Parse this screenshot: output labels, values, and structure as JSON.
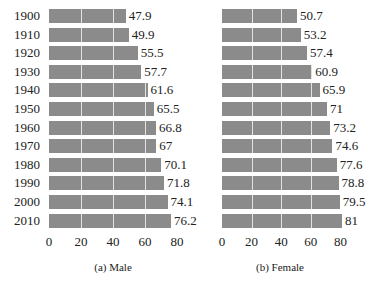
{
  "chart_data": [
    {
      "type": "bar",
      "orientation": "horizontal",
      "title": "",
      "caption": "(a) Male",
      "xlabel": "",
      "ylabel": "",
      "categories": [
        "1900",
        "1910",
        "1920",
        "1930",
        "1940",
        "1950",
        "1960",
        "1970",
        "1980",
        "1990",
        "2000",
        "2010"
      ],
      "values": [
        47.9,
        49.9,
        55.5,
        57.7,
        61.6,
        65.5,
        66.8,
        67,
        70.1,
        71.8,
        74.1,
        76.2
      ],
      "value_labels": [
        "47.9",
        "49.9",
        "55.5",
        "57.7",
        "61.6",
        "65.5",
        "66.8",
        "67",
        "70.1",
        "71.8",
        "74.1",
        "76.2"
      ],
      "xticks": [
        "0",
        "20",
        "40",
        "60",
        "80"
      ],
      "xlim": [
        0,
        85
      ],
      "grid": "vertical white lines at 20,40,60",
      "bar_color": "#8b8b8b"
    },
    {
      "type": "bar",
      "orientation": "horizontal",
      "title": "",
      "caption": "(b) Female",
      "xlabel": "",
      "ylabel": "",
      "categories": [
        "1900",
        "1910",
        "1920",
        "1930",
        "1940",
        "1950",
        "1960",
        "1970",
        "1980",
        "1990",
        "2000",
        "2010"
      ],
      "values": [
        50.7,
        53.2,
        57.4,
        60.9,
        65.9,
        71,
        73.2,
        74.6,
        77.6,
        78.8,
        79.5,
        81
      ],
      "value_labels": [
        "50.7",
        "53.2",
        "57.4",
        "60.9",
        "65.9",
        "71",
        "73.2",
        "74.6",
        "77.6",
        "78.8",
        "79.5",
        "81"
      ],
      "xticks": [
        "0",
        "20",
        "40",
        "60",
        "80"
      ],
      "xlim": [
        0,
        85
      ],
      "grid": "vertical white lines at 20,40,60",
      "bar_color": "#8b8b8b"
    }
  ]
}
